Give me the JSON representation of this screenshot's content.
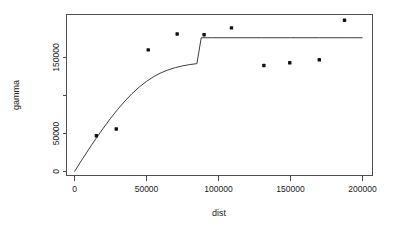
{
  "chart_data": {
    "type": "scatter",
    "title": "",
    "subtitle": "",
    "xlabel": "dist",
    "ylabel": "gamma",
    "xlim": [
      -7000,
      207000
    ],
    "ylim": [
      -12000,
      212000
    ],
    "grid": false,
    "legend": null,
    "x_ticks": [
      0,
      50000,
      100000,
      150000,
      200000
    ],
    "x_tick_labels": [
      "0",
      "50000",
      "100000",
      "150000",
      "200000"
    ],
    "y_ticks": [
      0,
      50000,
      100000,
      150000
    ],
    "y_tick_labels": [
      "0",
      "50000",
      "",
      "150000"
    ],
    "y_tick_labels_shown": [
      "0",
      "50000",
      "150000"
    ],
    "x": [
      15200,
      29000,
      51200,
      71300,
      90000,
      109000,
      131500,
      149500,
      170000,
      187500
    ],
    "y": [
      47000,
      56000,
      160000,
      181000,
      180000,
      189000,
      139500,
      143000,
      147000,
      199000
    ],
    "points": [
      {
        "dist": 15200,
        "gamma": 47000
      },
      {
        "dist": 29000,
        "gamma": 56000
      },
      {
        "dist": 51200,
        "gamma": 160000
      },
      {
        "dist": 71300,
        "gamma": 181000
      },
      {
        "dist": 90000,
        "gamma": 180000
      },
      {
        "dist": 109000,
        "gamma": 189000
      },
      {
        "dist": 131500,
        "gamma": 139500
      },
      {
        "dist": 149500,
        "gamma": 143000
      },
      {
        "dist": 170000,
        "gamma": 147000
      },
      {
        "dist": 187500,
        "gamma": 199000
      }
    ],
    "series": [
      {
        "name": "empirical-variogram",
        "type": "scatter",
        "values": [
          47000,
          56000,
          160000,
          181000,
          180000,
          189000,
          139500,
          143000,
          147000,
          199000
        ]
      },
      {
        "name": "fitted-variogram-model",
        "type": "line",
        "model": "spherical",
        "nugget": 0,
        "sill": 176000,
        "range": 88000,
        "x": [
          0,
          5000,
          10000,
          15000,
          20000,
          25000,
          30000,
          35000,
          40000,
          45000,
          50000,
          55000,
          60000,
          65000,
          70000,
          75000,
          80000,
          85000,
          88000,
          95000,
          110000,
          130000,
          150000,
          170000,
          190000,
          200000
        ],
        "values": [
          0,
          14900,
          29500,
          43600,
          57100,
          69900,
          81800,
          92700,
          102500,
          111200,
          118600,
          124800,
          129800,
          133700,
          136700,
          139000,
          140700,
          141900,
          176000,
          176000,
          176000,
          176000,
          176000,
          176000,
          176000,
          176000
        ]
      }
    ],
    "colors": {
      "point": "#111111",
      "curve": "#3d3d3d",
      "axis": "#4d4d4d",
      "background": "#ffffff",
      "text": "#1a1a1a"
    }
  }
}
